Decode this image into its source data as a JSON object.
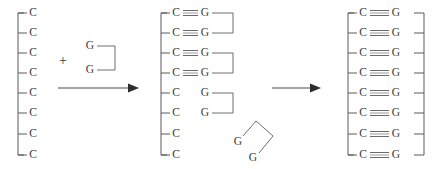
{
  "figure": {
    "type": "reaction-scheme",
    "background_color": "#ffffff",
    "ink_color": "#4a4a4a",
    "bond_color": "#9a9a9a",
    "letters": {
      "cytosine": "C",
      "guanine": "G"
    },
    "plus_symbol": "+"
  },
  "panels": [
    {
      "id": "panel-reactants",
      "name": "template-strand-and-monomer",
      "template": {
        "name": "poly-C-template",
        "backbone_orientation": "vertical-left",
        "residues": [
          "C",
          "C",
          "C",
          "C",
          "C",
          "C",
          "C",
          "C"
        ],
        "residue_count": 8,
        "paired_count": 0
      },
      "plus": "+",
      "free_dimers": [
        {
          "name": "GG-dimer-upright",
          "residues": [
            "G",
            "G"
          ],
          "linker_shape": "bracket-right",
          "rotation_deg": 0
        }
      ]
    },
    {
      "id": "panel-intermediate",
      "name": "partially-paired-duplex",
      "template": {
        "name": "poly-C-template",
        "backbone_orientation": "vertical-left",
        "residues": [
          "C",
          "C",
          "C",
          "C",
          "C",
          "C",
          "C",
          "C"
        ],
        "residue_count": 8,
        "paired_count": 4
      },
      "pairs": [
        {
          "left": "C",
          "right": "G",
          "bonded": true,
          "dimer_group": 1
        },
        {
          "left": "C",
          "right": "G",
          "bonded": true,
          "dimer_group": 1
        },
        {
          "left": "C",
          "right": "G",
          "bonded": true,
          "dimer_group": 2
        },
        {
          "left": "C",
          "right": "G",
          "bonded": true,
          "dimer_group": 2
        },
        {
          "left": "C",
          "right": "G",
          "bonded": false,
          "dimer_group": 3
        },
        {
          "left": "C",
          "right": "G",
          "bonded": false,
          "dimer_group": 3
        },
        {
          "left": "C",
          "right": "",
          "bonded": false,
          "dimer_group": 0
        },
        {
          "left": "C",
          "right": "",
          "bonded": false,
          "dimer_group": 0
        }
      ],
      "free_dimers": [
        {
          "name": "GG-dimer-rotated",
          "residues": [
            "G",
            "G"
          ],
          "linker_shape": "bracket-rotated",
          "rotation_deg": -40
        }
      ]
    },
    {
      "id": "panel-product",
      "name": "fully-paired-duplex",
      "template": {
        "name": "poly-C-template",
        "backbone_orientation": "vertical-left",
        "residues": [
          "C",
          "C",
          "C",
          "C",
          "C",
          "C",
          "C",
          "C"
        ],
        "residue_count": 8,
        "paired_count": 8
      },
      "complement": {
        "name": "poly-G-strand",
        "backbone_orientation": "vertical-right",
        "residues": [
          "G",
          "G",
          "G",
          "G",
          "G",
          "G",
          "G",
          "G"
        ],
        "residue_count": 8
      },
      "pairs": [
        {
          "left": "C",
          "right": "G",
          "bonded": true
        },
        {
          "left": "C",
          "right": "G",
          "bonded": true
        },
        {
          "left": "C",
          "right": "G",
          "bonded": true
        },
        {
          "left": "C",
          "right": "G",
          "bonded": true
        },
        {
          "left": "C",
          "right": "G",
          "bonded": true
        },
        {
          "left": "C",
          "right": "G",
          "bonded": true
        },
        {
          "left": "C",
          "right": "G",
          "bonded": true
        },
        {
          "left": "C",
          "right": "G",
          "bonded": true
        }
      ],
      "free_dimers": []
    }
  ],
  "arrows": [
    {
      "id": "arrow-1",
      "name": "reaction-arrow-first-step",
      "label": "",
      "direction": "right"
    },
    {
      "id": "arrow-2",
      "name": "reaction-arrow-second-step",
      "label": "",
      "direction": "right"
    }
  ]
}
